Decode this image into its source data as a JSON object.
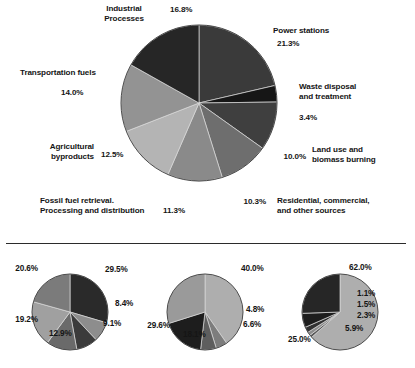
{
  "figure": {
    "background": "#ffffff",
    "divider_color": "#2b2b2b"
  },
  "chart_data": [
    {
      "type": "pie",
      "name": "main-pie",
      "title": "",
      "start_angle_deg": 0,
      "direction": "clockwise",
      "center": [
        199,
        103
      ],
      "radius": 78,
      "labels": [
        "Power stations",
        "Waste disposal and treatment",
        "Land use and biomass burning",
        "Residential, commercial, and other sources",
        "Fossil fuel retrieval. Processing and distribution",
        "Agricultural byproducts",
        "Transportation fuels",
        "Industrial Processes"
      ],
      "values": [
        21.3,
        3.4,
        10.0,
        10.3,
        11.3,
        12.5,
        14.0,
        16.8
      ],
      "value_labels": [
        "21.3%",
        "3.4%",
        "10.0%",
        "10.3%",
        "11.3%",
        "12.5%",
        "14.0%",
        "16.8%"
      ],
      "colors": [
        "#3a3a3a",
        "#161616",
        "#3f3f3f",
        "#6e6e6e",
        "#8a8a8a",
        "#b4b4b4",
        "#939393",
        "#262626"
      ],
      "legend": "none",
      "grid": false
    },
    {
      "type": "pie",
      "name": "small-pie-1",
      "start_angle_deg": 0,
      "direction": "clockwise",
      "center": [
        70,
        312
      ],
      "radius": 38,
      "values": [
        29.5,
        8.4,
        9.1,
        12.9,
        19.2,
        20.6
      ],
      "value_labels": [
        "29.5%",
        "8.4%",
        "9.1%",
        "12.9%",
        "19.2%",
        "20.6%"
      ],
      "colors": [
        "#2a2a2a",
        "#8d8d8d",
        "#3b3b3b",
        "#6a6a6a",
        "#a0a0a0",
        "#7b7b7b"
      ],
      "legend": "none",
      "grid": false
    },
    {
      "type": "pie",
      "name": "small-pie-2",
      "start_angle_deg": 0,
      "direction": "clockwise",
      "center": [
        205,
        312
      ],
      "radius": 38,
      "values": [
        40.0,
        4.8,
        6.6,
        18.1,
        29.6
      ],
      "value_labels": [
        "40.0%",
        "4.8%",
        "6.6%",
        "18.1%",
        "29.6%"
      ],
      "colors": [
        "#aeaeae",
        "#7d7d7d",
        "#5e5e5e",
        "#1d1d1d",
        "#9a9a9a"
      ],
      "legend": "none",
      "grid": false
    },
    {
      "type": "pie",
      "name": "small-pie-3",
      "start_angle_deg": 0,
      "direction": "clockwise",
      "center": [
        340,
        312
      ],
      "radius": 38,
      "values": [
        62.0,
        1.1,
        1.5,
        2.3,
        5.9,
        25.0
      ],
      "value_labels": [
        "62.0%",
        "1.1%",
        "1.5%",
        "2.3%",
        "5.9%",
        "25.0%"
      ],
      "colors": [
        "#aeaeae",
        "#5a5a5a",
        "#8c8c8c",
        "#313131",
        "#1d1d1d",
        "#262626"
      ],
      "legend": "none",
      "grid": false
    }
  ],
  "main_labels": {
    "industrial_processes": "Industrial\nProcesses",
    "industrial_processes_line1": "Industrial",
    "industrial_processes_line2": "Processes",
    "industrial_processes_pct": "16.8%",
    "power_stations": "Power stations",
    "power_stations_pct": "21.3%",
    "waste_disposal_line1": "Waste disposal",
    "waste_disposal_line2": "and treatment",
    "waste_disposal_pct": "3.4%",
    "land_use_line1": "Land use and",
    "land_use_line2": "biomass burning",
    "land_use_pct": "10.0%",
    "residential_line1": "Residential, commercial,",
    "residential_line2": "and other sources",
    "residential_pct": "10.3%",
    "fossil_fuel_line1": "Fossil fuel retrieval.",
    "fossil_fuel_line2": "Processing and distribution",
    "fossil_fuel_pct": "11.3%",
    "agricultural_line1": "Agricultural",
    "agricultural_line2": "byproducts",
    "agricultural_pct": "12.5%",
    "transportation": "Transportation fuels",
    "transportation_pct": "14.0%"
  },
  "small_pie_1_labels": {
    "p1": "29.5%",
    "p2": "8.4%",
    "p3": "9.1%",
    "p4": "12.9%",
    "p5": "19.2%",
    "p6": "20.6%"
  },
  "small_pie_2_labels": {
    "p1": "40.0%",
    "p2": "4.8%",
    "p3": "6.6%",
    "p4": "18.1%",
    "p5": "29.6%"
  },
  "small_pie_3_labels": {
    "p1": "62.0%",
    "p2": "1.1%",
    "p3": "1.5%",
    "p4": "2.3%",
    "p5": "5.9%",
    "p6": "25.0%"
  }
}
